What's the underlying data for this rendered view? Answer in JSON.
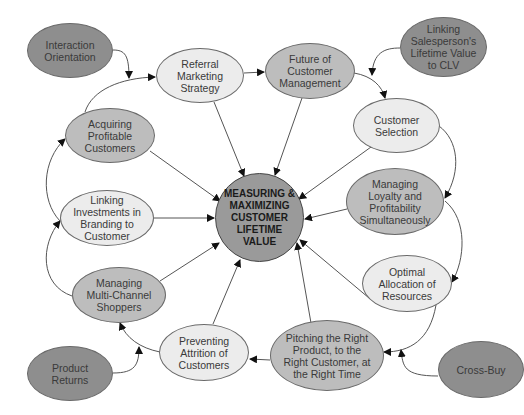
{
  "diagram": {
    "title": "MEASURING & MAXIMIZING CUSTOMER LIFETIME VALUE",
    "colors": {
      "dark": "#8e8e8e",
      "mid": "#bdbdbd",
      "light": "#ececec",
      "stroke": "#444444"
    },
    "center": {
      "label": "MEASURING &\nMAXIMIZING\nCUSTOMER\nLIFETIME\nVALUE"
    },
    "nodes": [
      {
        "id": "interaction-orientation",
        "label": "Interaction\nOrientation",
        "shade": "dark"
      },
      {
        "id": "referral-marketing",
        "label": "Referral\nMarketing\nStrategy",
        "shade": "light"
      },
      {
        "id": "future-customer-management",
        "label": "Future of\nCustomer\nManagement",
        "shade": "mid"
      },
      {
        "id": "linking-salesperson",
        "label": "Linking\nSalesperson's\nLifetime Value\nto CLV",
        "shade": "dark"
      },
      {
        "id": "customer-selection",
        "label": "Customer\nSelection",
        "shade": "light"
      },
      {
        "id": "acquiring-profitable",
        "label": "Acquiring\nProfitable\nCustomers",
        "shade": "mid"
      },
      {
        "id": "managing-loyalty",
        "label": "Managing\nLoyalty and\nProfitability\nSimultaneously",
        "shade": "mid"
      },
      {
        "id": "linking-investments",
        "label": "Linking\nInvestments in\nBranding to\nCustomer",
        "shade": "light"
      },
      {
        "id": "optimal-allocation",
        "label": "Optimal\nAllocation of\nResources",
        "shade": "light"
      },
      {
        "id": "managing-multichannel",
        "label": "Managing\nMulti-Channel\nShoppers",
        "shade": "mid"
      },
      {
        "id": "preventing-attrition",
        "label": "Preventing\nAttrition of\nCustomers",
        "shade": "light"
      },
      {
        "id": "pitching-right-product",
        "label": "Pitching the Right\nProduct, to the\nRight Customer, at\nthe Right Time",
        "shade": "mid"
      },
      {
        "id": "product-returns",
        "label": "Product\nReturns",
        "shade": "dark"
      },
      {
        "id": "cross-buy",
        "label": "Cross-Buy",
        "shade": "dark"
      }
    ]
  }
}
